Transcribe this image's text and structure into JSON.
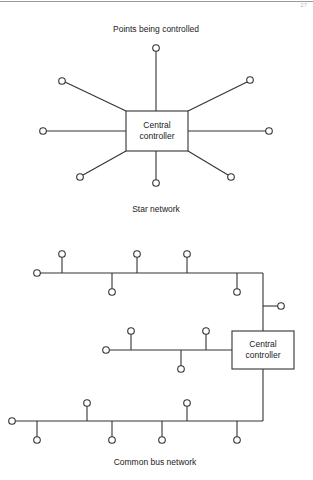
{
  "page": {
    "page_number": "27"
  },
  "star_network": {
    "heading": "Points being controlled",
    "controller_line1": "Central",
    "controller_line2": "controller",
    "caption": "Star network",
    "node_count": 8
  },
  "bus_network": {
    "controller_line1": "Central",
    "controller_line2": "controller",
    "caption": "Common bus network",
    "buses": [
      {
        "name": "upper-bus",
        "node_count": 6
      },
      {
        "name": "middle-bus",
        "node_count": 5
      },
      {
        "name": "lower-bus",
        "node_count": 7
      }
    ]
  },
  "colors": {
    "line": "#333333",
    "background": "#ffffff",
    "rule": "#9a9a9a"
  }
}
